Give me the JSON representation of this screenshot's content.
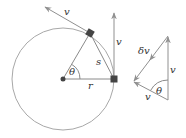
{
  "diagram": {
    "colors": {
      "circle": "#a8a8a8",
      "lines": "#8a8a8a",
      "arrows": "#909090",
      "points": "#444444",
      "text": "#333333"
    },
    "left_figure": {
      "circle": {
        "cx": 63,
        "cy": 79,
        "r": 51
      },
      "center_point": {
        "x": 63,
        "y": 79
      },
      "point_a": {
        "x": 90,
        "y": 33
      },
      "point_b": {
        "x": 114,
        "y": 79
      },
      "labels": {
        "tangent_velocity": "v",
        "vertical_velocity": "v",
        "chord": "s",
        "angle": "θ",
        "radius": "r"
      }
    },
    "right_figure": {
      "vertices": {
        "top": {
          "x": 168,
          "y": 36
        },
        "bottom": {
          "x": 168,
          "y": 100
        },
        "left": {
          "x": 133,
          "y": 82
        }
      },
      "labels": {
        "delta_v": "δv",
        "vertical_v": "v",
        "bottom_v": "v",
        "angle": "θ"
      }
    }
  }
}
